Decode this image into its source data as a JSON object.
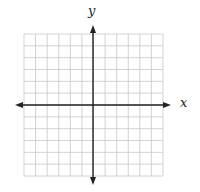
{
  "diagram": {
    "type": "coordinate-plane",
    "grid": {
      "columns": 12,
      "rows": 12,
      "left": 24,
      "top": 34,
      "right": 163,
      "bottom": 176,
      "line_color": "#c8c8c8"
    },
    "axes": {
      "color": "#222222",
      "x_axis_y": 105,
      "y_axis_x": 93,
      "x_arrow_left": 15,
      "x_arrow_right": 171,
      "y_arrow_top": 25,
      "y_arrow_bottom": 185
    },
    "labels": {
      "x_axis": "x",
      "y_axis": "y"
    }
  }
}
